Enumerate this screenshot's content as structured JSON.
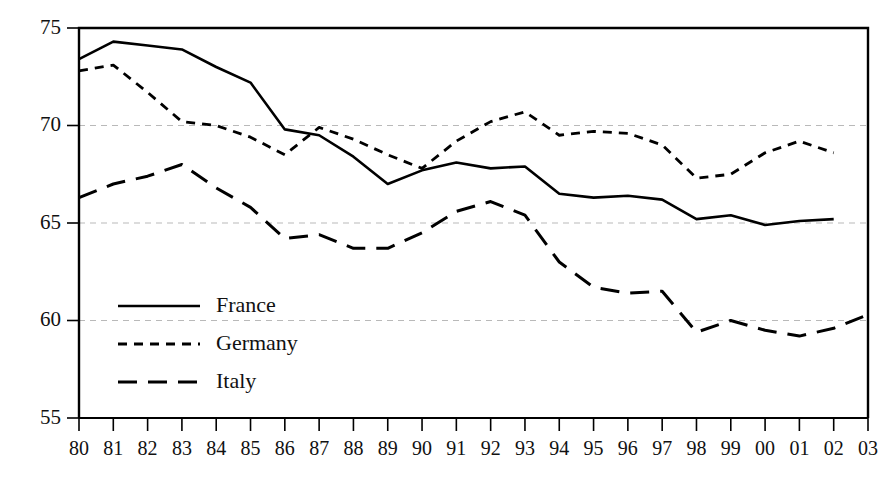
{
  "chart_data": {
    "type": "line",
    "title": "",
    "subtitle": "",
    "xlabel": "",
    "ylabel": "",
    "x": [
      "80",
      "81",
      "82",
      "83",
      "84",
      "85",
      "86",
      "87",
      "88",
      "89",
      "90",
      "91",
      "92",
      "93",
      "94",
      "95",
      "96",
      "97",
      "98",
      "99",
      "00",
      "01",
      "02",
      "03"
    ],
    "categories": [
      "80",
      "81",
      "82",
      "83",
      "84",
      "85",
      "86",
      "87",
      "88",
      "89",
      "90",
      "91",
      "92",
      "93",
      "94",
      "95",
      "96",
      "97",
      "98",
      "99",
      "00",
      "01",
      "02",
      "03"
    ],
    "xlim": [
      0,
      23
    ],
    "ylim": [
      55,
      75
    ],
    "yticks": [
      55,
      60,
      65,
      70,
      75
    ],
    "ytick_labels": [
      "55",
      "60",
      "65",
      "70",
      "75"
    ],
    "grid": "horizontal-dashed",
    "legend_position": "inside-left-lower",
    "series": [
      {
        "name": "France",
        "style": "solid",
        "values": [
          73.4,
          74.3,
          74.1,
          73.9,
          73.0,
          72.2,
          69.8,
          69.5,
          68.4,
          67.0,
          67.7,
          68.1,
          67.8,
          67.9,
          66.5,
          66.3,
          66.4,
          66.2,
          65.2,
          65.4,
          64.9,
          65.1,
          65.2,
          null
        ]
      },
      {
        "name": "Germany",
        "style": "short-dash",
        "values": [
          72.8,
          73.1,
          71.7,
          70.2,
          70.0,
          69.4,
          68.5,
          69.9,
          69.3,
          68.5,
          67.8,
          69.2,
          70.2,
          70.7,
          69.5,
          69.7,
          69.6,
          69.0,
          67.3,
          67.5,
          68.6,
          69.2,
          68.6,
          null
        ]
      },
      {
        "name": "Italy",
        "style": "long-dash",
        "values": [
          66.3,
          67.0,
          67.4,
          68.0,
          66.8,
          65.8,
          64.2,
          64.4,
          63.7,
          63.7,
          64.5,
          65.6,
          66.1,
          65.4,
          63.0,
          61.7,
          61.4,
          61.5,
          59.4,
          60.0,
          59.5,
          59.2,
          59.6,
          60.3
        ]
      }
    ]
  },
  "legend": {
    "items": [
      {
        "label": "France",
        "style": "solid"
      },
      {
        "label": "Germany",
        "style": "short-dash"
      },
      {
        "label": "Italy",
        "style": "long-dash"
      }
    ]
  },
  "axes": {
    "y_tick_labels": [
      "75",
      "70",
      "65",
      "60",
      "55"
    ],
    "x_tick_labels": [
      "80",
      "81",
      "82",
      "83",
      "84",
      "85",
      "86",
      "87",
      "88",
      "89",
      "90",
      "91",
      "92",
      "93",
      "94",
      "95",
      "96",
      "97",
      "98",
      "99",
      "00",
      "01",
      "02",
      "03"
    ]
  },
  "colors": {
    "line": "#000000",
    "grid": "#b9b9b9",
    "background": "#ffffff",
    "text": "#111111"
  }
}
